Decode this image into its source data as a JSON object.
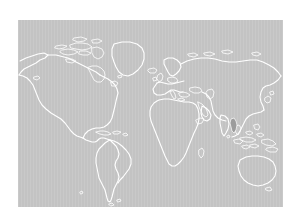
{
  "figure": {
    "name": "world-choropleth-map",
    "background_color": "#ffffff",
    "width": 297,
    "height": 222,
    "title": "",
    "caption": ""
  },
  "map": {
    "projection": "equirectangular",
    "panel": {
      "left": 18,
      "top": 20,
      "width": 265,
      "height": 187
    },
    "ocean_color": "#c3c3c3",
    "land_fill_color": "#c3c3c3",
    "coastline_color": "#ffffff",
    "highlight_color": "#9c9c9c",
    "lon_range": [
      -180,
      180
    ],
    "lat_range": [
      -60,
      84
    ],
    "graticule_visible": false,
    "labels_visible": false,
    "legend_visible": false,
    "antarctica_visible": false
  },
  "regions": [
    {
      "name": "north-america",
      "label": "North America",
      "highlighted": false
    },
    {
      "name": "greenland",
      "label": "Greenland",
      "highlighted": false
    },
    {
      "name": "south-america",
      "label": "South America",
      "highlighted": false
    },
    {
      "name": "europe",
      "label": "Europe",
      "highlighted": false
    },
    {
      "name": "africa",
      "label": "Africa",
      "highlighted": false
    },
    {
      "name": "asia",
      "label": "Asia",
      "highlighted": false
    },
    {
      "name": "australia",
      "label": "Australia",
      "highlighted": false
    },
    {
      "name": "new-zealand",
      "label": "New Zealand",
      "highlighted": false
    },
    {
      "name": "indochina",
      "label": "Indochina",
      "highlighted": true
    }
  ],
  "highlight": {
    "name": "highlighted-country",
    "label": "Myanmar",
    "color": "#9c9c9c",
    "approx_lon": 96,
    "approx_lat": 21
  }
}
